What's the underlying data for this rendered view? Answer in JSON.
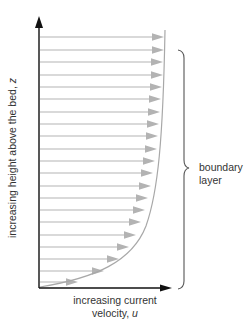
{
  "diagram": {
    "y_axis_label": "increasing height above the bed,",
    "y_axis_symbol": "z",
    "x_axis_label_line1": "increasing current",
    "x_axis_label_line2": "velocity,",
    "x_axis_symbol": "u",
    "brace_label_line1": "boundary",
    "brace_label_line2": "layer",
    "colors": {
      "axis": "#111111",
      "arrow": "#b3b3b3",
      "profile_curve": "#a8a8a8",
      "brace": "#555555",
      "text": "#333333"
    },
    "arrows": [
      {
        "y": 37,
        "tip_x": 164
      },
      {
        "y": 50,
        "tip_x": 164
      },
      {
        "y": 62,
        "tip_x": 163
      },
      {
        "y": 75,
        "tip_x": 163
      },
      {
        "y": 87,
        "tip_x": 162
      },
      {
        "y": 99,
        "tip_x": 161
      },
      {
        "y": 112,
        "tip_x": 160
      },
      {
        "y": 124,
        "tip_x": 159
      },
      {
        "y": 136,
        "tip_x": 158
      },
      {
        "y": 149,
        "tip_x": 157
      },
      {
        "y": 161,
        "tip_x": 155
      },
      {
        "y": 173,
        "tip_x": 153
      },
      {
        "y": 186,
        "tip_x": 151
      },
      {
        "y": 198,
        "tip_x": 148
      },
      {
        "y": 210,
        "tip_x": 145
      },
      {
        "y": 222,
        "tip_x": 141
      },
      {
        "y": 235,
        "tip_x": 136
      },
      {
        "y": 247,
        "tip_x": 129
      },
      {
        "y": 259,
        "tip_x": 119
      },
      {
        "y": 271,
        "tip_x": 104
      },
      {
        "y": 282,
        "tip_x": 78
      }
    ]
  }
}
